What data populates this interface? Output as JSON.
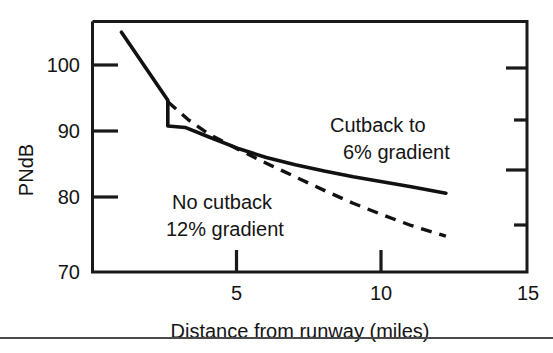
{
  "chart_data": {
    "type": "line",
    "title": "",
    "xlabel": "Distance from runway (miles)",
    "ylabel": "PNdB",
    "xlim": [
      0,
      15
    ],
    "ylim": [
      70,
      105
    ],
    "grid": false,
    "legend": "inline annotations",
    "x_ticks": [
      {
        "value": 5,
        "label": "5"
      },
      {
        "value": 10,
        "label": "10"
      },
      {
        "value": 15,
        "label": "15"
      }
    ],
    "y_ticks": [
      {
        "value": 100,
        "label": "100"
      },
      {
        "value": 90,
        "label": "90"
      },
      {
        "value": 80,
        "label": "80"
      },
      {
        "value": 70,
        "label": "70"
      }
    ],
    "right_axis_ticks": [
      100,
      95,
      90,
      85
    ],
    "series": [
      {
        "name": "Cutback to 6% gradient",
        "style": "solid",
        "points": [
          [
            1.0,
            103.5
          ],
          [
            2.6,
            94.0
          ],
          [
            2.6,
            90.4
          ],
          [
            3.2,
            90.2
          ],
          [
            4.0,
            88.9
          ],
          [
            5.0,
            87.3
          ],
          [
            6.0,
            86.0
          ],
          [
            7.0,
            85.0
          ],
          [
            8.0,
            84.1
          ],
          [
            9.0,
            83.3
          ],
          [
            10.0,
            82.6
          ],
          [
            11.0,
            81.9
          ],
          [
            12.2,
            81.0
          ]
        ]
      },
      {
        "name": "No cutback 12% gradient",
        "style": "dashed",
        "points": [
          [
            2.6,
            93.8
          ],
          [
            3.3,
            91.3
          ],
          [
            4.0,
            89.3
          ],
          [
            5.0,
            87.2
          ],
          [
            6.0,
            85.2
          ],
          [
            7.0,
            83.3
          ],
          [
            8.0,
            81.4
          ],
          [
            9.0,
            79.6
          ],
          [
            10.0,
            78.0
          ],
          [
            11.0,
            76.5
          ],
          [
            12.2,
            75.0
          ]
        ]
      }
    ],
    "annotations": [
      {
        "id": "cutback",
        "line1": "Cutback to",
        "line2": "6% gradient"
      },
      {
        "id": "nocutback",
        "line1": "No cutback",
        "line2": "12% gradient"
      }
    ]
  }
}
